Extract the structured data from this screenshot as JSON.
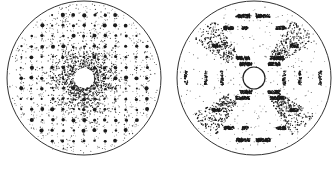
{
  "figure": {
    "width": 336,
    "height": 177,
    "background": "#ffffff",
    "ink": "#1a1a1a",
    "panels": [
      {
        "id": "left",
        "description": "diffraction pattern with square lattice of spots and diffuse central scattering",
        "center": [
          84,
          78
        ],
        "radius": 77,
        "hole_radius": 10,
        "pattern": "lattice",
        "lattice_spacing": 10.5,
        "central_halo_radius": 30
      },
      {
        "id": "right",
        "description": "diffraction pattern with streaked arcs in six-fold arrangement",
        "center": [
          254,
          78
        ],
        "radius": 77,
        "hole_radius": 11,
        "pattern": "streaks"
      }
    ],
    "labels": []
  }
}
